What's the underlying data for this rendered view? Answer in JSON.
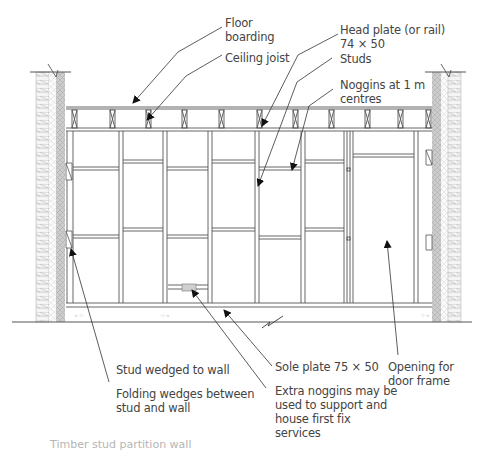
{
  "figure": {
    "caption_partial": "Timber stud partition wall",
    "colors": {
      "line": "#555555",
      "text": "#444444",
      "wall_hatch": "#cfcfcf",
      "insulation": "#bdbdbd"
    },
    "labels": {
      "floor_boarding": "Floor\nboarding",
      "ceiling_joist": "Ceiling joist",
      "head_plate": "Head plate (or rail)\n74 × 50",
      "studs": "Studs",
      "noggins": "Noggins at 1 m\ncentres",
      "stud_wedged": "Stud wedged to wall",
      "folding_wedges": "Folding wedges between\nstud and wall",
      "sole_plate": "Sole plate 75 × 50",
      "extra_noggins": "Extra noggins may be\nused to support and\nhouse first fix\nservices",
      "door_opening": "Opening for\ndoor frame"
    }
  }
}
